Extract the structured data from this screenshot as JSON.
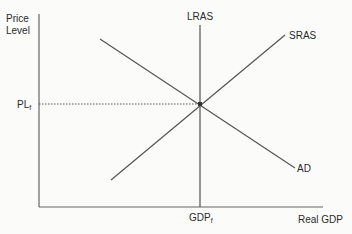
{
  "diagram": {
    "type": "aggregate-demand-supply",
    "y_axis_label_line1": "Price",
    "y_axis_label_line2": "Level",
    "x_axis_label": "Real GDP",
    "curves": {
      "lras": "LRAS",
      "sras": "SRAS",
      "ad": "AD"
    },
    "equilibrium": {
      "price_label": "PL",
      "price_subscript": "f",
      "output_label": "GDP",
      "output_subscript": "f"
    },
    "colors": {
      "line": "#555555",
      "axis": "#666666",
      "text": "#2a2a2a"
    }
  }
}
